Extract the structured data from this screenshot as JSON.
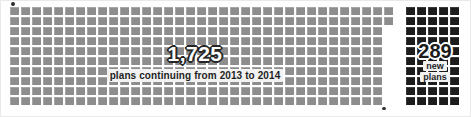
{
  "chart_data": {
    "type": "pictogram",
    "title": "",
    "unit_description": "Each square represents a group of plans",
    "categories": [
      "plans continuing from 2013 to 2014",
      "new plans"
    ],
    "values": [
      1725,
      289
    ],
    "series": [
      {
        "name": "continuing",
        "label": "1,725",
        "value": 1725,
        "caption": "plans continuing from 2013 to 2014",
        "color": "#8d8d8d",
        "grid": {
          "columns": 34,
          "rows": 10,
          "extra_top_rows": 2,
          "extra_top_columns": 1
        }
      },
      {
        "name": "new",
        "label": "289",
        "value": 289,
        "caption_lines": [
          "new",
          "plans"
        ],
        "color": "#1c1c1c",
        "grid": {
          "columns": 5,
          "rows": 10
        }
      }
    ],
    "legend": "none",
    "grid_on": false
  },
  "main_block": {
    "value_label": "1,725",
    "caption": "plans continuing from 2013 to 2014",
    "cell_color": "#8d8d8d",
    "columns": 34,
    "rows": 10,
    "long_row_columns": 35,
    "long_rows": 2
  },
  "new_block": {
    "value_label": "289",
    "caption_line_1": "new",
    "caption_line_2": "plans",
    "cell_color": "#1c1c1c",
    "columns": 5,
    "rows": 10
  },
  "colors": {
    "background": "#ffffff",
    "continuing_squares": "#8d8d8d",
    "new_squares": "#1c1c1c",
    "label_box": "#f2f2f2",
    "label_text": "#1f1f1f",
    "outline_dark": "#262626",
    "outline_light": "#ffffff"
  }
}
